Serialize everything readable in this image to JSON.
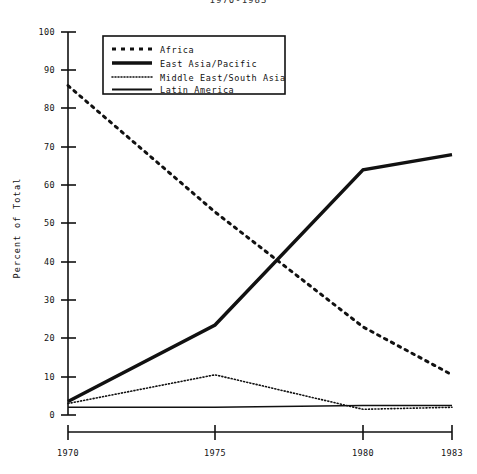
{
  "title": "1970-1983",
  "axis": {
    "ylabel": "Percent of Total",
    "yticks": [
      "0",
      "10",
      "20",
      "30",
      "40",
      "50",
      "60",
      "70",
      "80",
      "90",
      "100"
    ],
    "xticks": [
      "1970",
      "1975",
      "1980",
      "1983"
    ]
  },
  "legend": {
    "items": [
      {
        "label": "Africa",
        "style": "dashed"
      },
      {
        "label": "East Asia/Pacific",
        "style": "thick-solid"
      },
      {
        "label": "Middle East/South Asia",
        "style": "dotted"
      },
      {
        "label": "Latin America",
        "style": "solid"
      }
    ]
  },
  "chart_data": {
    "type": "line",
    "title": "1970-1983",
    "xlabel": "",
    "ylabel": "Percent of Total",
    "x": [
      1970,
      1975,
      1980,
      1983
    ],
    "xlim": [
      1970,
      1983
    ],
    "ylim": [
      0,
      100
    ],
    "yticks": [
      0,
      10,
      20,
      30,
      40,
      50,
      60,
      70,
      80,
      90,
      100
    ],
    "xticks": [
      1970,
      1975,
      1980,
      1983
    ],
    "grid": false,
    "legend_position": "top-left-inside",
    "series": [
      {
        "name": "Africa",
        "style": "dashed",
        "values": [
          86,
          53,
          23,
          10.5
        ]
      },
      {
        "name": "East Asia/Pacific",
        "style": "thick-solid",
        "values": [
          3.5,
          23.5,
          64,
          68
        ]
      },
      {
        "name": "Middle East/South Asia",
        "style": "dotted",
        "values": [
          3,
          10.5,
          1.5,
          2
        ]
      },
      {
        "name": "Latin America",
        "style": "solid",
        "values": [
          2,
          2,
          2.5,
          2.5
        ]
      }
    ]
  }
}
